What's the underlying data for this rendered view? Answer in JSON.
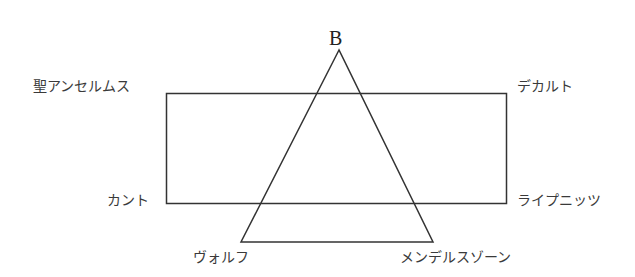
{
  "diagram": {
    "apex_label": "B",
    "rectangle_corners": {
      "top_left": "聖アンセルムス",
      "top_right": "デカルト",
      "bottom_left": "カント",
      "bottom_right": "ライプニッツ"
    },
    "triangle_base": {
      "left": "ヴォルフ",
      "right": "メンデルスゾーン"
    },
    "colors": {
      "line": "#333333",
      "text": "#3a3a3a"
    }
  }
}
